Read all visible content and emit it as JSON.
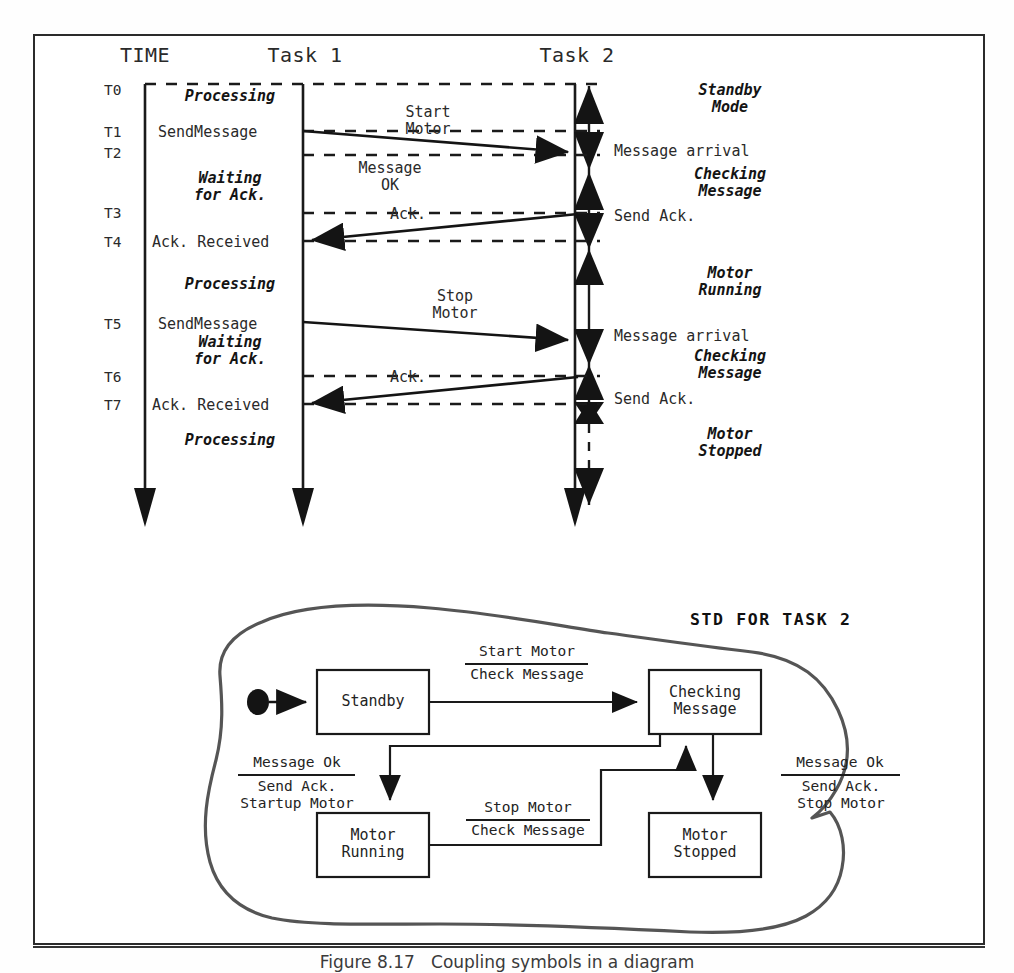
{
  "figure": {
    "caption": "Figure 8.17   Coupling symbols in a diagram",
    "frame_color": "#2b2b2b",
    "ink_color": "#1a1a1a"
  },
  "sequence_diagram": {
    "columns": [
      {
        "id": "time",
        "header": "TIME"
      },
      {
        "id": "task1",
        "header": "Task 1"
      },
      {
        "id": "task2",
        "header": "Task 2"
      }
    ],
    "time_marks": [
      "T0",
      "T1",
      "T2",
      "T3",
      "T4",
      "T5",
      "T6",
      "T7"
    ],
    "task1_events": [
      {
        "text": "Processing",
        "style": "state"
      },
      {
        "text": "SendMessage",
        "style": "plain"
      },
      {
        "text": "Waiting\nfor Ack.",
        "style": "state"
      },
      {
        "text": "Ack. Received",
        "style": "plain"
      },
      {
        "text": "Processing",
        "style": "state"
      },
      {
        "text": "SendMessage",
        "style": "plain"
      },
      {
        "text": "Waiting\nfor Ack.",
        "style": "state"
      },
      {
        "text": "Ack. Received",
        "style": "plain"
      },
      {
        "text": "Processing",
        "style": "state"
      }
    ],
    "messages": [
      {
        "label": "Start\nMotor",
        "direction": "right"
      },
      {
        "label": "Message\nOK",
        "direction": "none"
      },
      {
        "label": "Ack.",
        "direction": "left"
      },
      {
        "label": "Stop\nMotor",
        "direction": "right"
      },
      {
        "label": "Ack.",
        "direction": "left"
      }
    ],
    "task2_events": [
      {
        "text": "Standby\nMode",
        "style": "state"
      },
      {
        "text": "Message arrival",
        "style": "plain"
      },
      {
        "text": "Checking\nMessage",
        "style": "state"
      },
      {
        "text": "Send Ack.",
        "style": "plain"
      },
      {
        "text": "Motor\nRunning",
        "style": "state"
      },
      {
        "text": "Message arrival",
        "style": "plain"
      },
      {
        "text": "Checking\nMessage",
        "style": "state"
      },
      {
        "text": "Send Ack.",
        "style": "plain"
      },
      {
        "text": "Motor\nStopped",
        "style": "state"
      }
    ]
  },
  "std": {
    "title": "STD FOR TASK 2",
    "states": [
      {
        "id": "standby",
        "label": "Standby"
      },
      {
        "id": "checking",
        "label": "Checking\nMessage"
      },
      {
        "id": "running",
        "label": "Motor\nRunning"
      },
      {
        "id": "stopped",
        "label": "Motor\nStopped"
      }
    ],
    "transitions": [
      {
        "from": "initial",
        "to": "standby",
        "event": "",
        "action": ""
      },
      {
        "from": "standby",
        "to": "checking",
        "event": "Start Motor",
        "action": "Check Message"
      },
      {
        "from": "checking",
        "to": "running",
        "event": "Message Ok",
        "action": "Send Ack.\nStartup Motor"
      },
      {
        "from": "running",
        "to": "checking",
        "event": "Stop Motor",
        "action": "Check Message"
      },
      {
        "from": "checking",
        "to": "stopped",
        "event": "Message Ok",
        "action": "Send Ack.\nStop Motor"
      }
    ]
  }
}
